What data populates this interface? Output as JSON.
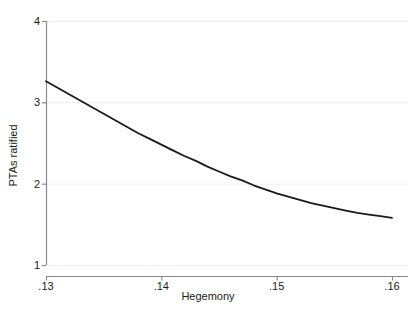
{
  "chart_data": {
    "type": "line",
    "title": "",
    "subtitle": "",
    "xlabel": "Hegemony",
    "ylabel": "PTAs ratified",
    "xlim": [
      0.13,
      0.16
    ],
    "ylim": [
      1,
      4
    ],
    "xticks": [
      0.13,
      0.14,
      0.15,
      0.16
    ],
    "xtick_labels": [
      ".13",
      ".14",
      ".15",
      ".16"
    ],
    "yticks": [
      1,
      2,
      3,
      4
    ],
    "ytick_labels": [
      "1",
      "2",
      "3",
      "4"
    ],
    "grid": "horizontal",
    "legend": "none",
    "series": [
      {
        "name": "predicted PTAs ratified",
        "color": "#1a1a1a",
        "line_width": 1.8,
        "x": [
          0.13,
          0.131,
          0.132,
          0.133,
          0.134,
          0.135,
          0.136,
          0.137,
          0.138,
          0.139,
          0.14,
          0.141,
          0.142,
          0.143,
          0.144,
          0.145,
          0.146,
          0.147,
          0.148,
          0.149,
          0.15,
          0.151,
          0.152,
          0.153,
          0.154,
          0.155,
          0.156,
          0.157,
          0.158,
          0.159,
          0.16
        ],
        "y": [
          3.26,
          3.18,
          3.1,
          3.02,
          2.94,
          2.86,
          2.78,
          2.7,
          2.62,
          2.55,
          2.48,
          2.41,
          2.34,
          2.28,
          2.21,
          2.15,
          2.09,
          2.04,
          1.98,
          1.93,
          1.88,
          1.84,
          1.8,
          1.76,
          1.73,
          1.7,
          1.67,
          1.64,
          1.62,
          1.6,
          1.58
        ]
      }
    ],
    "colors": {
      "line": "#1a1a1a",
      "axis": "#8a8a8a",
      "grid": "#ededed",
      "background": "#ffffff",
      "text": "#1a1a1a"
    }
  },
  "axes": {
    "x": {
      "title": "Hegemony",
      "ticks": [
        {
          "label": ".13",
          "value": 0.13
        },
        {
          "label": ".14",
          "value": 0.14
        },
        {
          "label": ".15",
          "value": 0.15
        },
        {
          "label": ".16",
          "value": 0.16
        }
      ]
    },
    "y": {
      "title": "PTAs ratified",
      "ticks": [
        {
          "label": "4",
          "value": 4
        },
        {
          "label": "3",
          "value": 3
        },
        {
          "label": "2",
          "value": 2
        },
        {
          "label": "1",
          "value": 1
        }
      ]
    }
  }
}
